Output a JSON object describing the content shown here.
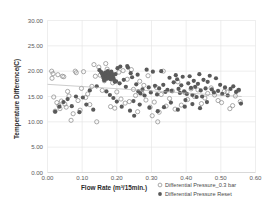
{
  "chart_data": {
    "type": "scatter",
    "title": "",
    "xlabel": "Flow Rate (m³/15min.)",
    "ylabel": "Temperature Difference(C)",
    "xlim": [
      0.0,
      0.6
    ],
    "ylim": [
      0.0,
      30.0
    ],
    "xticks": [
      "0.00",
      "0.10",
      "0.20",
      "0.30",
      "0.40",
      "0.50",
      "0.60"
    ],
    "xtick_values": [
      0.0,
      0.1,
      0.2,
      0.3,
      0.4,
      0.5,
      0.6
    ],
    "yticks": [
      "0.00",
      "5.00",
      "10.00",
      "15.00",
      "20.00",
      "25.00",
      "30.00"
    ],
    "ytick_values": [
      0,
      5,
      10,
      15,
      20,
      25,
      30
    ],
    "grid": true,
    "legend_position": "bottom-right",
    "colors": {
      "series1_stroke": "#8d8d8d",
      "series2_fill": "#595959",
      "gridline": "#e2e2e2",
      "trendline": "#b6b6b6",
      "background": "#ffffff"
    },
    "series": [
      {
        "name": "Differential Pressure_0.3 bar",
        "marker": "open-circle",
        "points": [
          [
            0.012,
            20.0
          ],
          [
            0.013,
            18.6
          ],
          [
            0.016,
            19.5
          ],
          [
            0.018,
            14.9
          ],
          [
            0.022,
            12.1
          ],
          [
            0.027,
            13.8
          ],
          [
            0.03,
            19.3
          ],
          [
            0.033,
            13.2
          ],
          [
            0.036,
            12.6
          ],
          [
            0.04,
            14.1
          ],
          [
            0.043,
            19.0
          ],
          [
            0.047,
            18.9
          ],
          [
            0.05,
            13.5
          ],
          [
            0.054,
            12.9
          ],
          [
            0.058,
            16.0
          ],
          [
            0.062,
            15.1
          ],
          [
            0.068,
            10.3
          ],
          [
            0.074,
            11.6
          ],
          [
            0.08,
            20.0
          ],
          [
            0.083,
            19.7
          ],
          [
            0.088,
            14.2
          ],
          [
            0.094,
            12.3
          ],
          [
            0.098,
            16.6
          ],
          [
            0.104,
            19.9
          ],
          [
            0.11,
            14.8
          ],
          [
            0.116,
            15.5
          ],
          [
            0.122,
            13.4
          ],
          [
            0.128,
            17.0
          ],
          [
            0.134,
            21.3
          ],
          [
            0.138,
            19.0
          ],
          [
            0.142,
            10.0
          ],
          [
            0.148,
            20.8
          ],
          [
            0.152,
            19.2
          ],
          [
            0.158,
            16.2
          ],
          [
            0.164,
            18.1
          ],
          [
            0.168,
            21.5
          ],
          [
            0.172,
            20.4
          ],
          [
            0.178,
            19.6
          ],
          [
            0.182,
            13.0
          ],
          [
            0.188,
            17.7
          ],
          [
            0.194,
            12.7
          ],
          [
            0.2,
            15.9
          ],
          [
            0.206,
            19.8
          ],
          [
            0.212,
            14.5
          ],
          [
            0.218,
            20.1
          ],
          [
            0.224,
            13.7
          ],
          [
            0.23,
            18.4
          ],
          [
            0.236,
            14.0
          ],
          [
            0.242,
            20.3
          ],
          [
            0.248,
            16.4
          ],
          [
            0.254,
            15.2
          ],
          [
            0.26,
            12.0
          ],
          [
            0.266,
            18.0
          ],
          [
            0.272,
            15.7
          ],
          [
            0.278,
            17.2
          ],
          [
            0.284,
            14.3
          ],
          [
            0.29,
            19.1
          ],
          [
            0.296,
            12.9
          ],
          [
            0.302,
            11.2
          ],
          [
            0.308,
            13.9
          ],
          [
            0.314,
            16.8
          ],
          [
            0.318,
            10.0
          ],
          [
            0.322,
            11.9
          ],
          [
            0.328,
            15.4
          ],
          [
            0.334,
            20.0
          ],
          [
            0.342,
            13.1
          ],
          [
            0.352,
            14.6
          ],
          [
            0.36,
            16.1
          ],
          [
            0.368,
            12.5
          ],
          [
            0.376,
            17.9
          ],
          [
            0.386,
            13.3
          ],
          [
            0.396,
            15.8
          ],
          [
            0.404,
            14.4
          ],
          [
            0.414,
            16.5
          ],
          [
            0.424,
            15.0
          ],
          [
            0.434,
            16.3
          ],
          [
            0.444,
            13.6
          ],
          [
            0.454,
            14.7
          ],
          [
            0.462,
            15.6
          ],
          [
            0.472,
            16.7
          ],
          [
            0.482,
            15.3
          ],
          [
            0.492,
            14.2
          ],
          [
            0.502,
            13.8
          ],
          [
            0.51,
            16.0
          ],
          [
            0.518,
            15.9
          ],
          [
            0.526,
            12.6
          ],
          [
            0.534,
            13.2
          ],
          [
            0.542,
            15.1
          ],
          [
            0.55,
            16.2
          ],
          [
            0.556,
            14.0
          ]
        ]
      },
      {
        "name": "Differential Pressure Reset",
        "marker": "filled-circle",
        "points": [
          [
            0.022,
            12.0
          ],
          [
            0.034,
            13.0
          ],
          [
            0.046,
            13.9
          ],
          [
            0.058,
            14.5
          ],
          [
            0.07,
            13.1
          ],
          [
            0.082,
            15.0
          ],
          [
            0.092,
            11.9
          ],
          [
            0.102,
            14.8
          ],
          [
            0.112,
            13.4
          ],
          [
            0.122,
            16.2
          ],
          [
            0.132,
            12.4
          ],
          [
            0.142,
            17.0
          ],
          [
            0.15,
            20.2
          ],
          [
            0.155,
            19.8
          ],
          [
            0.158,
            19.4
          ],
          [
            0.16,
            19.0
          ],
          [
            0.162,
            18.6
          ],
          [
            0.164,
            18.2
          ],
          [
            0.166,
            19.7
          ],
          [
            0.168,
            19.3
          ],
          [
            0.17,
            18.9
          ],
          [
            0.172,
            18.5
          ],
          [
            0.174,
            20.0
          ],
          [
            0.176,
            19.6
          ],
          [
            0.178,
            19.2
          ],
          [
            0.18,
            18.8
          ],
          [
            0.182,
            18.4
          ],
          [
            0.184,
            19.9
          ],
          [
            0.186,
            19.5
          ],
          [
            0.188,
            19.1
          ],
          [
            0.19,
            18.7
          ],
          [
            0.192,
            18.3
          ],
          [
            0.194,
            17.9
          ],
          [
            0.196,
            19.4
          ],
          [
            0.198,
            18.0
          ],
          [
            0.202,
            20.6
          ],
          [
            0.208,
            17.6
          ],
          [
            0.214,
            13.0
          ],
          [
            0.22,
            18.3
          ],
          [
            0.226,
            16.9
          ],
          [
            0.232,
            20.7
          ],
          [
            0.238,
            12.2
          ],
          [
            0.244,
            18.8
          ],
          [
            0.25,
            11.2
          ],
          [
            0.256,
            17.4
          ],
          [
            0.262,
            16.0
          ],
          [
            0.268,
            15.6
          ],
          [
            0.274,
            16.4
          ],
          [
            0.28,
            15.2
          ],
          [
            0.286,
            20.3
          ],
          [
            0.292,
            16.8
          ],
          [
            0.298,
            15.8
          ],
          [
            0.304,
            19.9
          ],
          [
            0.31,
            17.1
          ],
          [
            0.316,
            15.4
          ],
          [
            0.322,
            16.6
          ],
          [
            0.328,
            20.0
          ],
          [
            0.334,
            17.3
          ],
          [
            0.34,
            15.9
          ],
          [
            0.346,
            16.3
          ],
          [
            0.352,
            18.7
          ],
          [
            0.358,
            16.1
          ],
          [
            0.364,
            17.8
          ],
          [
            0.37,
            19.2
          ],
          [
            0.374,
            18.4
          ],
          [
            0.378,
            16.5
          ],
          [
            0.382,
            15.7
          ],
          [
            0.386,
            17.2
          ],
          [
            0.39,
            18.9
          ],
          [
            0.394,
            16.0
          ],
          [
            0.398,
            14.3
          ],
          [
            0.402,
            15.5
          ],
          [
            0.406,
            17.6
          ],
          [
            0.41,
            19.0
          ],
          [
            0.414,
            16.7
          ],
          [
            0.418,
            15.3
          ],
          [
            0.422,
            18.1
          ],
          [
            0.426,
            16.9
          ],
          [
            0.43,
            14.9
          ],
          [
            0.434,
            17.5
          ],
          [
            0.438,
            19.4
          ],
          [
            0.442,
            16.2
          ],
          [
            0.446,
            15.0
          ],
          [
            0.45,
            18.3
          ],
          [
            0.456,
            16.6
          ],
          [
            0.462,
            17.9
          ],
          [
            0.468,
            19.1
          ],
          [
            0.474,
            16.4
          ],
          [
            0.48,
            15.8
          ],
          [
            0.486,
            18.6
          ],
          [
            0.492,
            16.1
          ],
          [
            0.498,
            17.3
          ],
          [
            0.504,
            15.5
          ],
          [
            0.512,
            16.8
          ],
          [
            0.52,
            15.2
          ],
          [
            0.528,
            16.5
          ],
          [
            0.536,
            17.0
          ],
          [
            0.544,
            15.9
          ],
          [
            0.552,
            16.3
          ],
          [
            0.558,
            13.6
          ],
          [
            0.24,
            19.6
          ],
          [
            0.248,
            14.1
          ],
          [
            0.266,
            13.4
          ],
          [
            0.294,
            12.8
          ],
          [
            0.318,
            12.1
          ],
          [
            0.336,
            12.9
          ],
          [
            0.356,
            13.8
          ],
          [
            0.376,
            12.4
          ],
          [
            0.396,
            13.0
          ],
          [
            0.418,
            13.5
          ],
          [
            0.44,
            12.7
          ],
          [
            0.46,
            13.9
          ],
          [
            0.17,
            16.0
          ],
          [
            0.18,
            15.3
          ],
          [
            0.19,
            14.7
          ],
          [
            0.2,
            14.0
          ],
          [
            0.21,
            20.9
          ],
          [
            0.23,
            21.0
          ],
          [
            0.26,
            19.3
          ]
        ]
      }
    ],
    "trendline": {
      "name": "linear-fit",
      "x_start": 0.0,
      "y_start": 17.4,
      "x_end": 0.56,
      "y_end": 15.0
    }
  },
  "legend": {
    "items": [
      {
        "label": "Differential Pressure_0.3 bar",
        "marker": "open-circle"
      },
      {
        "label": "Differential Pressure Reset",
        "marker": "filled-circle"
      }
    ]
  }
}
